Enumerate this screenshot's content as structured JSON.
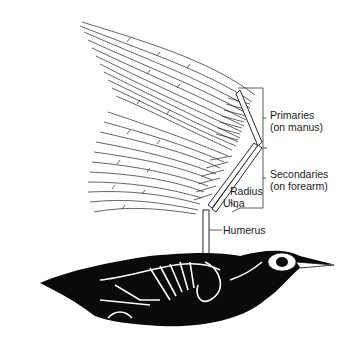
{
  "figure": {
    "labels": {
      "primaries": {
        "line1": "Primaries",
        "line2": "(on manus)"
      },
      "secondaries": {
        "line1": "Secondaries",
        "line2": "(on forearm)"
      },
      "radius": "Radius",
      "ulna": "Ulna",
      "humerus": "Humerus"
    },
    "colors": {
      "ink": "#111111",
      "background": "#ffffff",
      "bone": "#ffffff"
    }
  }
}
